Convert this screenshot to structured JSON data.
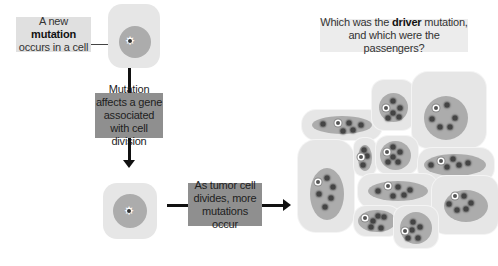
{
  "labels": {
    "new_mutation": {
      "pre": "A new ",
      "bold": "mutation",
      "post": " occurs in a cell"
    },
    "affects_gene": "Mutation affects a gene associated with cell division",
    "divides": "As tumor cell divides, more mutations occur",
    "question": {
      "pre": "Which was the ",
      "bold": "driver",
      "post": " mutation, and which were the passengers?"
    }
  },
  "colors": {
    "cytoplasm": "#e6e6e6",
    "nucleus": "#acacac",
    "light_label": "#e0e0e0",
    "dark_label": "#8f8f8f",
    "mutation_dot": "#444444",
    "arrow": "#111111"
  },
  "single_cells": [
    {
      "id": "original-cell",
      "x": 108,
      "y": 4,
      "w": 52,
      "h": 64,
      "nx": 119,
      "ny": 26,
      "nr": 32,
      "driver": {
        "x": 130,
        "y": 41
      }
    },
    {
      "id": "mutated-cell",
      "x": 103,
      "y": 183,
      "w": 54,
      "h": 56,
      "nx": 113,
      "ny": 194,
      "nr": 34,
      "driver": {
        "x": 129,
        "y": 211
      }
    }
  ],
  "tumor_cells": [
    {
      "x": 302,
      "y": 110,
      "w": 80,
      "h": 30,
      "r": 14,
      "n": {
        "x": 312,
        "y": 116,
        "w": 60,
        "h": 18
      },
      "driver": [
        338,
        123
      ],
      "dots": [
        [
          323,
          124
        ],
        [
          349,
          123
        ],
        [
          361,
          125
        ],
        [
          343,
          131
        ],
        [
          353,
          130
        ]
      ]
    },
    {
      "x": 372,
      "y": 80,
      "w": 42,
      "h": 50,
      "r": 12,
      "n": {
        "x": 379,
        "y": 93,
        "w": 29,
        "h": 29
      },
      "driver": [
        386,
        108
      ],
      "dots": [
        [
          393,
          101
        ],
        [
          400,
          108
        ],
        [
          393,
          113
        ],
        [
          388,
          118
        ],
        [
          399,
          117
        ]
      ]
    },
    {
      "x": 412,
      "y": 72,
      "w": 74,
      "h": 76,
      "r": 16,
      "n": {
        "x": 424,
        "y": 96,
        "w": 44,
        "h": 44
      },
      "driver": [
        436,
        108
      ],
      "dots": [
        [
          447,
          105
        ],
        [
          432,
          119
        ],
        [
          455,
          118
        ],
        [
          440,
          127
        ],
        [
          450,
          127
        ]
      ]
    },
    {
      "x": 298,
      "y": 140,
      "w": 56,
      "h": 92,
      "r": 18,
      "n": {
        "x": 310,
        "y": 168,
        "w": 34,
        "h": 52
      },
      "driver": [
        318,
        182
      ],
      "dots": [
        [
          327,
          178
        ],
        [
          333,
          187
        ],
        [
          319,
          194
        ],
        [
          331,
          198
        ],
        [
          325,
          207
        ]
      ]
    },
    {
      "x": 354,
      "y": 138,
      "w": 22,
      "h": 38,
      "r": 9,
      "n": {
        "x": 358,
        "y": 145,
        "w": 14,
        "h": 26
      },
      "driver": [
        361,
        157
      ],
      "dots": [
        [
          364,
          150
        ],
        [
          367,
          156
        ],
        [
          363,
          165
        ]
      ]
    },
    {
      "x": 376,
      "y": 136,
      "w": 42,
      "h": 38,
      "r": 12,
      "n": {
        "x": 380,
        "y": 141,
        "w": 31,
        "h": 29
      },
      "driver": [
        387,
        152
      ],
      "dots": [
        [
          393,
          147
        ],
        [
          400,
          152
        ],
        [
          393,
          157
        ],
        [
          388,
          162
        ],
        [
          398,
          162
        ]
      ]
    },
    {
      "x": 418,
      "y": 148,
      "w": 76,
      "h": 34,
      "r": 14,
      "n": {
        "x": 424,
        "y": 154,
        "w": 62,
        "h": 22
      },
      "driver": [
        441,
        161
      ],
      "dots": [
        [
          431,
          165
        ],
        [
          453,
          159
        ],
        [
          447,
          167
        ],
        [
          459,
          165
        ],
        [
          468,
          163
        ]
      ]
    },
    {
      "x": 358,
      "y": 174,
      "w": 80,
      "h": 34,
      "r": 14,
      "n": {
        "x": 368,
        "y": 181,
        "w": 60,
        "h": 20
      },
      "driver": [
        388,
        186
      ],
      "dots": [
        [
          378,
          191
        ],
        [
          398,
          187
        ],
        [
          410,
          190
        ],
        [
          393,
          196
        ],
        [
          404,
          195
        ]
      ]
    },
    {
      "x": 432,
      "y": 176,
      "w": 66,
      "h": 58,
      "r": 14,
      "n": {
        "x": 444,
        "y": 190,
        "w": 44,
        "h": 32
      },
      "driver": [
        455,
        196
      ],
      "dots": [
        [
          464,
          196
        ],
        [
          449,
          204
        ],
        [
          471,
          203
        ],
        [
          457,
          210
        ],
        [
          466,
          209
        ]
      ]
    },
    {
      "x": 354,
      "y": 206,
      "w": 46,
      "h": 30,
      "r": 12,
      "n": {
        "x": 358,
        "y": 210,
        "w": 38,
        "h": 22
      },
      "driver": [
        365,
        218
      ],
      "dots": [
        [
          373,
          221
        ],
        [
          378,
          216
        ],
        [
          384,
          217
        ],
        [
          371,
          227
        ],
        [
          381,
          228
        ]
      ]
    },
    {
      "x": 394,
      "y": 206,
      "w": 44,
      "h": 42,
      "r": 12,
      "n": {
        "x": 400,
        "y": 212,
        "w": 32,
        "h": 32
      },
      "driver": [
        405,
        231
      ],
      "dots": [
        [
          413,
          222
        ],
        [
          420,
          227
        ],
        [
          412,
          230
        ],
        [
          408,
          238
        ],
        [
          418,
          238
        ]
      ]
    }
  ]
}
